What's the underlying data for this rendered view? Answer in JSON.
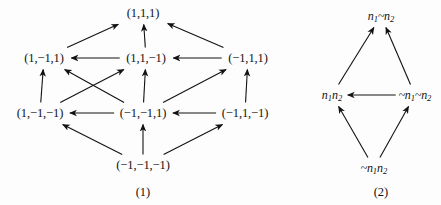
{
  "figure": {
    "background_color": "#fdfdfd",
    "ink_color": "#121212"
  },
  "diagrams": [
    {
      "id": "diagram-1",
      "caption": "(1)",
      "nodes": [
        {
          "id": "n111",
          "label": "(1,1,1)",
          "x": 143,
          "y": 13
        },
        {
          "id": "n1m11",
          "label": "(1,−1,1)",
          "x": 44,
          "y": 58
        },
        {
          "id": "n11m1",
          "label": "(1,1,−1)",
          "x": 146,
          "y": 58
        },
        {
          "id": "nm111",
          "label": "(−1,1,1)",
          "x": 248,
          "y": 58
        },
        {
          "id": "n1m1m1",
          "label": "(1,−1,−1)",
          "x": 40,
          "y": 113
        },
        {
          "id": "nm1m11",
          "label": "(−1,−1,1)",
          "x": 143,
          "y": 113
        },
        {
          "id": "nm11m1",
          "label": "(−1,1,−1)",
          "x": 245,
          "y": 113
        },
        {
          "id": "nm1m1m1",
          "label": "(−1,−1,−1)",
          "x": 143,
          "y": 165
        }
      ],
      "edges": [
        {
          "from": "n1m11",
          "to": "n111"
        },
        {
          "from": "n11m1",
          "to": "n111"
        },
        {
          "from": "nm111",
          "to": "n111"
        },
        {
          "from": "n11m1",
          "to": "n1m11"
        },
        {
          "from": "nm111",
          "to": "n11m1"
        },
        {
          "from": "n1m1m1",
          "to": "n1m11"
        },
        {
          "from": "nm1m11",
          "to": "n1m11"
        },
        {
          "from": "n1m1m1",
          "to": "n11m1"
        },
        {
          "from": "nm1m11",
          "to": "n11m1"
        },
        {
          "from": "nm1m11",
          "to": "nm111"
        },
        {
          "from": "nm11m1",
          "to": "nm111"
        },
        {
          "from": "nm1m11",
          "to": "n1m1m1"
        },
        {
          "from": "nm11m1",
          "to": "nm1m11"
        },
        {
          "from": "nm1m1m1",
          "to": "n1m1m1"
        },
        {
          "from": "nm1m1m1",
          "to": "nm1m11"
        },
        {
          "from": "nm1m1m1",
          "to": "nm11m1"
        }
      ],
      "caption_x": 143,
      "caption_y": 192
    },
    {
      "id": "diagram-2",
      "caption": "(2)",
      "nodes": [
        {
          "id": "top",
          "label": "n₁~n₂",
          "x": 381,
          "y": 16
        },
        {
          "id": "left",
          "label": "n₁n₂",
          "x": 332,
          "y": 95
        },
        {
          "id": "right",
          "label": "~n₁~n₂",
          "x": 415,
          "y": 95
        },
        {
          "id": "bottom",
          "label": "~n₁n₂",
          "x": 374,
          "y": 168
        }
      ],
      "edges": [
        {
          "from": "left",
          "to": "top"
        },
        {
          "from": "right",
          "to": "top"
        },
        {
          "from": "right",
          "to": "left"
        },
        {
          "from": "bottom",
          "to": "left"
        },
        {
          "from": "bottom",
          "to": "right"
        }
      ],
      "caption_x": 381,
      "caption_y": 192
    }
  ]
}
